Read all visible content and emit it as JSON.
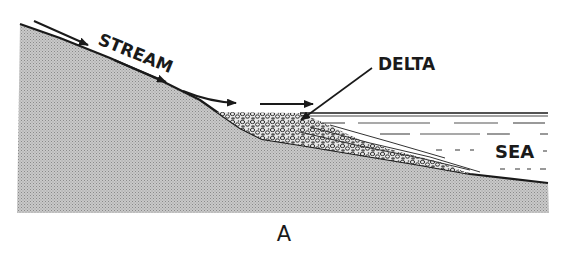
{
  "diagram": {
    "labels": {
      "stream": "STREAM",
      "delta": "DELTA",
      "sea": "SEA"
    },
    "caption": "A",
    "colors": {
      "land_fill": "#b8b8b8",
      "outline": "#1a1a1a",
      "background": "#ffffff",
      "sediment": "#5a5a5a"
    }
  }
}
